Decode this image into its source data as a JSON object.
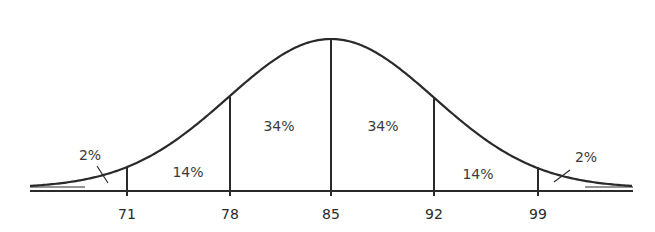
{
  "chart_data": {
    "type": "area",
    "title": "",
    "subtitle": "",
    "xlabel": "",
    "ylabel": "",
    "mean": 85,
    "std_dev": 7,
    "x_ticks": [
      "71",
      "78",
      "85",
      "92",
      "99"
    ],
    "x": [
      71,
      78,
      85,
      92,
      99
    ],
    "regions": [
      {
        "range": "< 71",
        "percent": "2%"
      },
      {
        "range": "71-78",
        "percent": "14%"
      },
      {
        "range": "78-85",
        "percent": "34%"
      },
      {
        "range": "85-92",
        "percent": "34%"
      },
      {
        "range": "92-99",
        "percent": "14%"
      },
      {
        "range": "> 99",
        "percent": "2%"
      }
    ],
    "grid": false,
    "legend": "none"
  },
  "labels": {
    "left_tail": "2%",
    "seg1": "14%",
    "seg2": "34%",
    "seg3": "34%",
    "seg4": "14%",
    "right_tail": "2%"
  },
  "ticks": {
    "t1": "71",
    "t2": "78",
    "t3": "85",
    "t4": "92",
    "t5": "99"
  },
  "colors": {
    "line": "#2a2a2a",
    "background": "#ffffff"
  }
}
